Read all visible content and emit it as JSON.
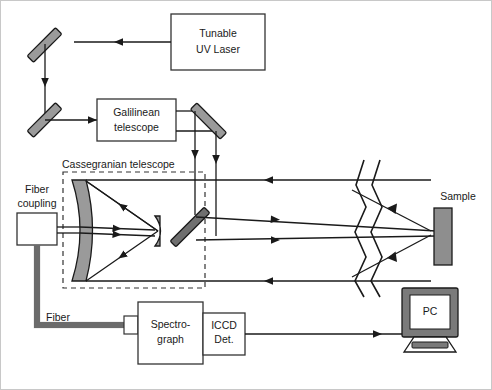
{
  "figure": {
    "kind": "optical-setup-schematic",
    "background": "#ffffff",
    "border_color": "#c8c8c8"
  },
  "colors": {
    "line": "#1a1a1a",
    "mirror_fill": "#9a9a9a",
    "mirror_stroke": "#1a1a1a",
    "fiber": "#7d7d7d",
    "box_fill": "#ffffff",
    "box_stroke": "#333333",
    "dashed_stroke": "#333333",
    "sample_fill": "#8e8e8e",
    "monitor_bezel": "#7a7a7a",
    "text": "#1a1a1a"
  },
  "components": {
    "laser": {
      "label_line1": "Tunable",
      "label_line2": "UV Laser"
    },
    "galilean": {
      "label_line1": "Galilinean",
      "label_line2": "telescope"
    },
    "cassegrain": {
      "label": "Cassegranian telescope"
    },
    "fiber_coupling": {
      "label_line1": "Fiber",
      "label_line2": "coupling"
    },
    "fiber": {
      "label": "Fiber"
    },
    "spectrograph": {
      "label_line1": "Spectro-",
      "label_line2": "graph"
    },
    "iccd": {
      "label_line1": "ICCD",
      "label_line2": "Det."
    },
    "pc": {
      "label": "PC"
    },
    "sample": {
      "label": "Sample"
    }
  }
}
